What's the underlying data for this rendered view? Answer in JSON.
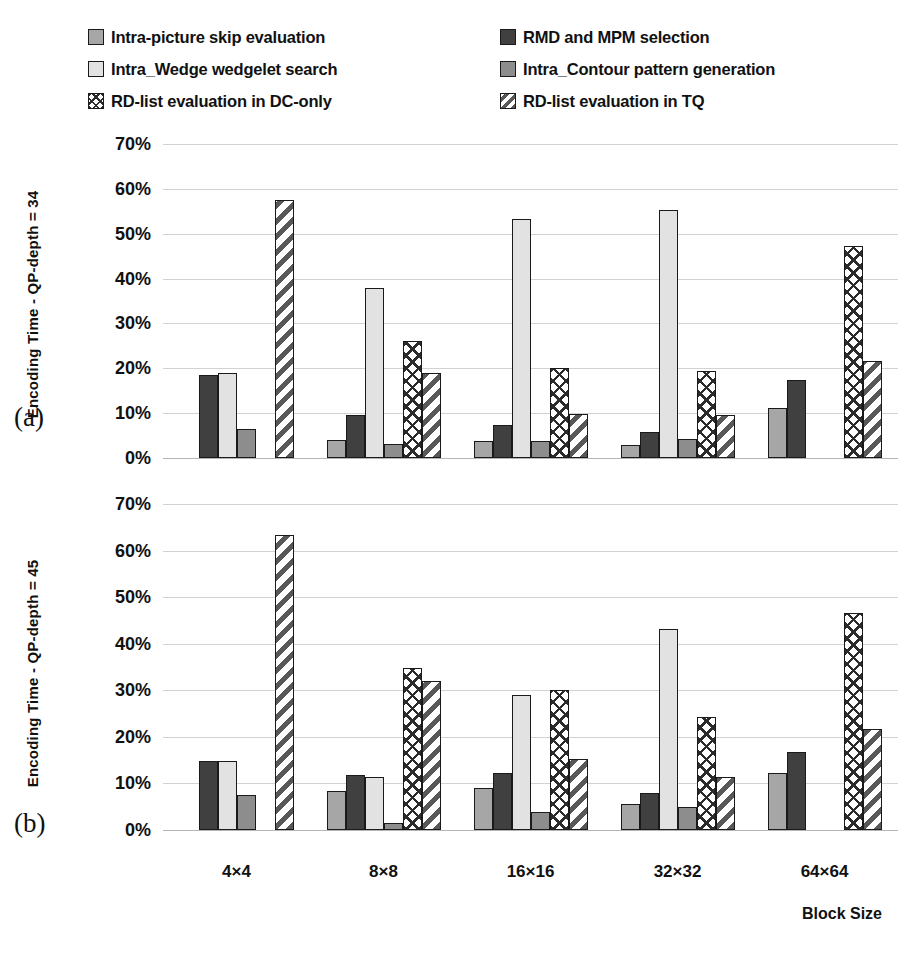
{
  "legend": {
    "left_column": [
      {
        "label": "Intra-picture skip evaluation",
        "key": "skip",
        "swatch": "solid-light-gray"
      },
      {
        "label": "Intra_Wedge wedgelet search",
        "key": "wedge",
        "swatch": "solid-very-light-gray"
      },
      {
        "label": "RD-list evaluation in DC-only",
        "key": "dc",
        "swatch": "cross-hatch"
      }
    ],
    "right_column": [
      {
        "label": "RMD and MPM selection",
        "key": "rmd",
        "swatch": "solid-dark-gray"
      },
      {
        "label": "Intra_Contour pattern generation",
        "key": "contour",
        "swatch": "solid-medium-gray"
      },
      {
        "label": "RD-list evaluation in TQ",
        "key": "tq",
        "swatch": "diagonal-hatch"
      }
    ]
  },
  "panels": [
    {
      "id": "a",
      "panel_label": "(a)",
      "ylabel": "Encoding Time - QP-depth = 34"
    },
    {
      "id": "b",
      "panel_label": "(b)",
      "ylabel": "Encoding Time - QP-depth = 45"
    }
  ],
  "axis": {
    "ytick_labels": [
      "70%",
      "60%",
      "50%",
      "40%",
      "30%",
      "20%",
      "10%",
      "0%"
    ],
    "xtick_labels": [
      "4×4",
      "8×8",
      "16×16",
      "32×32",
      "64×64"
    ],
    "xtitle": "Block Size"
  },
  "colors": {
    "skip": "#a6a6a6",
    "rmd": "#404040",
    "wedge": "#e2e2e2",
    "contour": "#8d8d8d",
    "dc": "#ffffff",
    "tq": "#ffffff",
    "outline": "#1a1a1a",
    "grid": "#d2d2d2",
    "background": "#ffffff"
  },
  "chart_data": [
    {
      "type": "bar",
      "id": "a",
      "title": "Encoding Time - QP-depth = 34",
      "xlabel": "Block Size",
      "ylabel": "Encoding Time - QP-depth = 34",
      "ylim": [
        0,
        70
      ],
      "ytick_step": 10,
      "yunit": "%",
      "grid": true,
      "legend_position": "top",
      "categories": [
        "4×4",
        "8×8",
        "16×16",
        "32×32",
        "64×64"
      ],
      "series": [
        {
          "name": "Intra-picture skip evaluation",
          "key": "skip",
          "values": [
            null,
            4.1,
            3.8,
            2.8,
            11.2
          ]
        },
        {
          "name": "RMD and MPM selection",
          "key": "rmd",
          "values": [
            18.5,
            9.7,
            7.4,
            5.7,
            17.5
          ]
        },
        {
          "name": "Intra_Wedge wedgelet search",
          "key": "wedge",
          "values": [
            18.9,
            37.9,
            53.3,
            55.4,
            null
          ]
        },
        {
          "name": "Intra_Contour pattern generation",
          "key": "contour",
          "values": [
            6.4,
            3.2,
            3.9,
            4.2,
            null
          ]
        },
        {
          "name": "RD-list evaluation in DC-only",
          "key": "dc",
          "values": [
            null,
            26.0,
            20.1,
            19.5,
            47.2
          ]
        },
        {
          "name": "RD-list evaluation in TQ",
          "key": "tq",
          "values": [
            57.5,
            19.0,
            9.8,
            9.5,
            21.6
          ]
        }
      ]
    },
    {
      "type": "bar",
      "id": "b",
      "title": "Encoding Time - QP-depth = 45",
      "xlabel": "Block Size",
      "ylabel": "Encoding Time - QP-depth = 45",
      "ylim": [
        0,
        70
      ],
      "ytick_step": 10,
      "yunit": "%",
      "grid": true,
      "legend_position": "top",
      "categories": [
        "4×4",
        "8×8",
        "16×16",
        "32×32",
        "64×64"
      ],
      "series": [
        {
          "name": "Intra-picture skip evaluation",
          "key": "skip",
          "values": [
            null,
            8.3,
            9.0,
            5.6,
            12.2
          ]
        },
        {
          "name": "RMD and MPM selection",
          "key": "rmd",
          "values": [
            14.8,
            11.9,
            12.2,
            7.9,
            16.8
          ]
        },
        {
          "name": "Intra_Wedge wedgelet search",
          "key": "wedge",
          "values": [
            14.8,
            11.4,
            28.9,
            43.2,
            null
          ]
        },
        {
          "name": "Intra_Contour pattern generation",
          "key": "contour",
          "values": [
            7.5,
            1.5,
            3.9,
            5.0,
            null
          ]
        },
        {
          "name": "RD-list evaluation in DC-only",
          "key": "dc",
          "values": [
            null,
            34.8,
            30.1,
            24.2,
            46.6
          ]
        },
        {
          "name": "RD-list evaluation in TQ",
          "key": "tq",
          "values": [
            63.3,
            32.0,
            15.2,
            11.4,
            21.7
          ]
        }
      ]
    }
  ]
}
